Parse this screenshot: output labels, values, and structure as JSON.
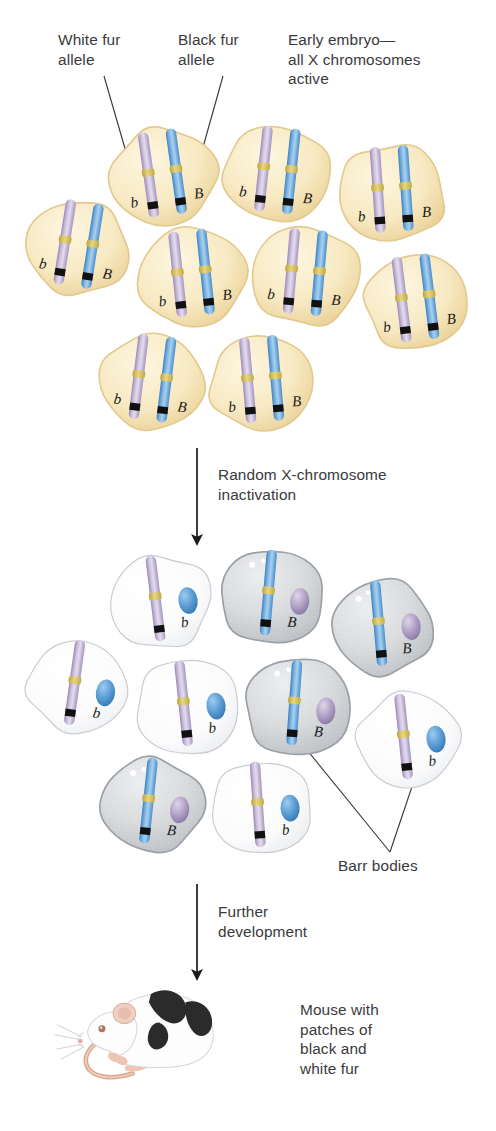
{
  "figure": {
    "background": "#ffffff",
    "width": 496,
    "height": 1131
  },
  "colors": {
    "white_fur_chromosome": "#b9a9cc",
    "black_fur_chromosome": "#5b9bd5",
    "centromere": "#d4c05a",
    "band": "#111111",
    "embryo_cell_fill": "#f7eac5",
    "embryo_cell_rim": "#e2c98d",
    "inactive_white_cell_fill": "#fbfbfc",
    "inactive_white_cell_rim": "#c9cdd2",
    "inactive_gray_cell_fill": "#d8dadc",
    "inactive_gray_cell_rim": "#9aa0a6",
    "text": "#3a3a3c",
    "leader_line": "#3a3a3c",
    "arrow": "#1a1a1a",
    "mouse_body": "#fdfdfd",
    "mouse_patch": "#2b2b2b",
    "mouse_tail": "#e0b49c",
    "mouse_ear": "#e9c3b4"
  },
  "callouts": [
    {
      "id": "white-fur-allele",
      "text": "White fur\nallele",
      "x": 58,
      "y": 30
    },
    {
      "id": "black-fur-allele",
      "text": "Black fur\nallele",
      "x": 178,
      "y": 30
    },
    {
      "id": "early-embryo",
      "text": "Early embryo—\nall X chromosomes\nactive",
      "x": 288,
      "y": 30
    },
    {
      "id": "barr-bodies",
      "text": "Barr bodies",
      "x": 338,
      "y": 856
    }
  ],
  "stage_labels": [
    {
      "id": "inactivation-label",
      "text": "Random X-chromosome\ninactivation",
      "x": 218,
      "y": 465
    },
    {
      "id": "development-label",
      "text": "Further\ndevelopment",
      "x": 218,
      "y": 902
    }
  ],
  "mouse_caption": {
    "text": "Mouse with\npatches of\nblack and\nwhite fur",
    "x": 300,
    "y": 1000
  },
  "alleles": {
    "white": "b",
    "black": "B"
  },
  "arrows": [
    {
      "id": "arrow-inactivation",
      "x": 197,
      "y1": 448,
      "y2": 540
    },
    {
      "id": "arrow-development",
      "x": 197,
      "y1": 884,
      "y2": 975
    }
  ],
  "embryo_cells": [
    {
      "id": "e1",
      "cx": 163,
      "cy": 177,
      "rx": 55,
      "ry": 50,
      "rot": -8,
      "labelDy": 30
    },
    {
      "id": "e2",
      "cx": 277,
      "cy": 174,
      "rx": 56,
      "ry": 49,
      "rot": 6,
      "labelDy": 30
    },
    {
      "id": "e3",
      "cx": 392,
      "cy": 193,
      "rx": 56,
      "ry": 50,
      "rot": -4,
      "labelDy": 30
    },
    {
      "id": "e4",
      "cx": 78,
      "cy": 248,
      "rx": 54,
      "ry": 48,
      "rot": 9,
      "labelDy": 30
    },
    {
      "id": "e5",
      "cx": 192,
      "cy": 277,
      "rx": 56,
      "ry": 51,
      "rot": -6,
      "labelDy": 30
    },
    {
      "id": "e6",
      "cx": 305,
      "cy": 276,
      "rx": 56,
      "ry": 51,
      "rot": 5,
      "labelDy": 30
    },
    {
      "id": "e7",
      "cx": 416,
      "cy": 302,
      "rx": 53,
      "ry": 49,
      "rot": -7,
      "labelDy": 30
    },
    {
      "id": "e8",
      "cx": 152,
      "cy": 382,
      "rx": 54,
      "ry": 49,
      "rot": 7,
      "labelDy": 30
    },
    {
      "id": "e9",
      "cx": 262,
      "cy": 383,
      "rx": 54,
      "ry": 49,
      "rot": -5,
      "labelDy": 30
    }
  ],
  "inactivated_cells": [
    {
      "id": "i1",
      "cx": 160,
      "cy": 602,
      "rx": 52,
      "ry": 48,
      "rot": -7,
      "active": "b",
      "barr": "B"
    },
    {
      "id": "i2",
      "cx": 272,
      "cy": 597,
      "rx": 54,
      "ry": 49,
      "rot": 5,
      "active": "B",
      "barr": "b"
    },
    {
      "id": "i3",
      "cx": 383,
      "cy": 627,
      "rx": 52,
      "ry": 49,
      "rot": -5,
      "active": "B",
      "barr": "b"
    },
    {
      "id": "i4",
      "cx": 78,
      "cy": 687,
      "rx": 52,
      "ry": 47,
      "rot": 8,
      "active": "b",
      "barr": "B"
    },
    {
      "id": "i5",
      "cx": 188,
      "cy": 707,
      "rx": 54,
      "ry": 50,
      "rot": -6,
      "active": "b",
      "barr": "B"
    },
    {
      "id": "i6",
      "cx": 298,
      "cy": 707,
      "rx": 55,
      "ry": 51,
      "rot": 4,
      "active": "B",
      "barr": "b"
    },
    {
      "id": "i7",
      "cx": 408,
      "cy": 740,
      "rx": 52,
      "ry": 49,
      "rot": -6,
      "active": "b",
      "barr": "B"
    },
    {
      "id": "i8",
      "cx": 152,
      "cy": 805,
      "rx": 53,
      "ry": 48,
      "rot": 6,
      "active": "B",
      "barr": "b"
    },
    {
      "id": "i9",
      "cx": 262,
      "cy": 808,
      "rx": 53,
      "ry": 48,
      "rot": -4,
      "active": "b",
      "barr": "B"
    }
  ],
  "leader_lines": [
    {
      "id": "lead-white-allele",
      "x1": 104,
      "y1": 76,
      "x2": 137,
      "y2": 190
    },
    {
      "id": "lead-black-allele",
      "x1": 223,
      "y1": 76,
      "x2": 191,
      "y2": 190
    },
    {
      "id": "lead-barr-left",
      "x1": 390,
      "y1": 852,
      "x2": 281,
      "y2": 718
    },
    {
      "id": "lead-barr-right",
      "x1": 390,
      "y1": 852,
      "x2": 425,
      "y2": 748
    }
  ]
}
